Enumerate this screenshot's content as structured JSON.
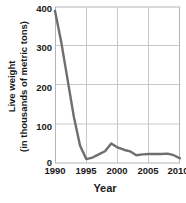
{
  "chart_data": {
    "type": "line",
    "title": "",
    "xlabel": "Year",
    "ylabel": "Live weight (in thousands of metric tons)",
    "ylabel_line1": "Live weight",
    "ylabel_line2": "(in thousands of metric tons)",
    "x": [
      1990,
      1991,
      1992,
      1993,
      1994,
      1995,
      1996,
      1997,
      1998,
      1999,
      2000,
      2001,
      2002,
      2003,
      2004,
      2005,
      2006,
      2007,
      2008,
      2009,
      2010
    ],
    "values": [
      390,
      310,
      215,
      120,
      45,
      10,
      14,
      22,
      30,
      50,
      40,
      34,
      30,
      20,
      22,
      23,
      23,
      23,
      24,
      20,
      12
    ],
    "series": [
      {
        "name": "Live weight",
        "values": [
          390,
          310,
          215,
          120,
          45,
          10,
          14,
          22,
          30,
          50,
          40,
          34,
          30,
          20,
          22,
          23,
          23,
          23,
          24,
          20,
          12
        ]
      }
    ],
    "xlim": [
      1990,
      2010
    ],
    "ylim": [
      0,
      400
    ],
    "xticks": [
      1990,
      1995,
      2000,
      2005,
      2010
    ],
    "yticks": [
      0,
      100,
      200,
      300,
      400
    ],
    "xtick_labels": [
      "1990",
      "1995",
      "2000",
      "2005",
      "2010"
    ],
    "ytick_labels": [
      "0",
      "100",
      "200",
      "300",
      "400"
    ],
    "grid": true,
    "grid_axis": "both",
    "legend": false,
    "legend_position": "none",
    "line_color": "#6e6e6e",
    "grid_color": "#c8c8c8",
    "text_color": "#1a1a1a",
    "background": "#ffffff",
    "line_width": 2.4,
    "annotations": []
  }
}
